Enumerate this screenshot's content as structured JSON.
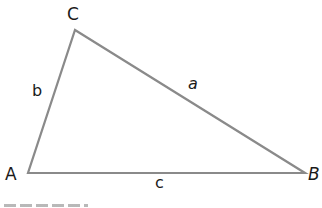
{
  "diagram": {
    "type": "triangle",
    "stroke_color": "#8a8a8a",
    "vertices": [
      {
        "label": "A",
        "x": 28,
        "y": 173
      },
      {
        "label": "B",
        "x": 305,
        "y": 173
      },
      {
        "label": "C",
        "x": 75,
        "y": 30
      }
    ],
    "sides": [
      {
        "label": "a",
        "from": "B",
        "to": "C"
      },
      {
        "label": "b",
        "from": "A",
        "to": "C"
      },
      {
        "label": "c",
        "from": "A",
        "to": "B"
      }
    ]
  },
  "labels": {
    "A": "A",
    "B": "B",
    "C": "C",
    "a": "a",
    "b": "b",
    "c": "c"
  }
}
